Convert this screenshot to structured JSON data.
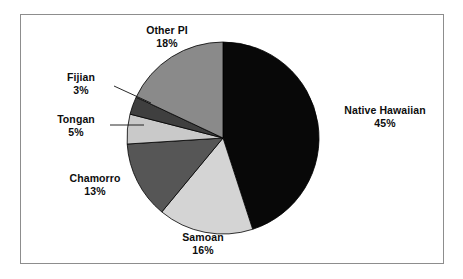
{
  "figure": {
    "frame_border_color": "#8d8d8d",
    "background_color": "#ffffff"
  },
  "chart_data": {
    "type": "pie",
    "title": "",
    "subtitle": "",
    "xlabel": "",
    "ylabel": "",
    "grid": false,
    "legend_position": "none",
    "labels_position": "outside-with-leader-lines",
    "start_angle_deg": 0,
    "direction": "clockwise",
    "units": "percent",
    "categories": [
      "Native Hawaiian",
      "Samoan",
      "Chamorro",
      "Tongan",
      "Fijian",
      "Other PI"
    ],
    "values": [
      45,
      16,
      13,
      5,
      3,
      18
    ],
    "colors": [
      "#080808",
      "#d4d4d4",
      "#565656",
      "#c9c9c9",
      "#3f3f3f",
      "#8a8a8a"
    ],
    "slices": [
      {
        "label": "Native Hawaiian",
        "value": 45,
        "text": "45%",
        "color": "#080808"
      },
      {
        "label": "Samoan",
        "value": 16,
        "text": "16%",
        "color": "#d4d4d4"
      },
      {
        "label": "Chamorro",
        "value": 13,
        "text": "13%",
        "color": "#565656"
      },
      {
        "label": "Tongan",
        "value": 5,
        "text": "5%",
        "color": "#c9c9c9"
      },
      {
        "label": "Fijian",
        "value": 3,
        "text": "3%",
        "color": "#3f3f3f"
      },
      {
        "label": "Other PI",
        "value": 18,
        "text": "18%",
        "color": "#8a8a8a"
      }
    ]
  },
  "labels": {
    "native_hawaiian": {
      "name": "Native Hawaiian",
      "pct": "45%"
    },
    "samoan": {
      "name": "Samoan",
      "pct": "16%"
    },
    "chamorro": {
      "name": "Chamorro",
      "pct": "13%"
    },
    "tongan": {
      "name": "Tongan",
      "pct": "5%"
    },
    "fijian": {
      "name": "Fijian",
      "pct": "3%"
    },
    "other_pi": {
      "name": "Other PI",
      "pct": "18%"
    }
  }
}
